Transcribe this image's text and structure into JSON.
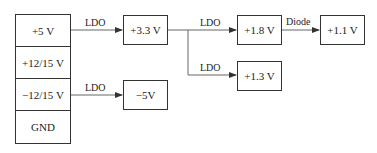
{
  "diagram": {
    "source_rails": [
      "+5 V",
      "+12/15 V",
      "−12/15 V",
      "GND"
    ],
    "nodes": {
      "v3_3": "+3.3 V",
      "v_minus5": "−5V",
      "v1_8": "+1.8 V",
      "v1_1": "+1.1 V",
      "v1_3": "+1.3 V"
    },
    "edges": [
      {
        "from": "+5 V",
        "to": "+3.3 V",
        "label": "LDO"
      },
      {
        "from": "−12/15 V",
        "to": "−5V",
        "label": "LDO"
      },
      {
        "from": "+3.3 V",
        "to": "+1.8 V",
        "label": "LDO"
      },
      {
        "from": "+3.3 V",
        "to": "+1.3 V",
        "label": "LDO"
      },
      {
        "from": "+1.8 V",
        "to": "+1.1 V",
        "label": "Diode"
      }
    ],
    "colors": {
      "line": "#555555",
      "border": "#333333",
      "text": "#222222"
    }
  }
}
